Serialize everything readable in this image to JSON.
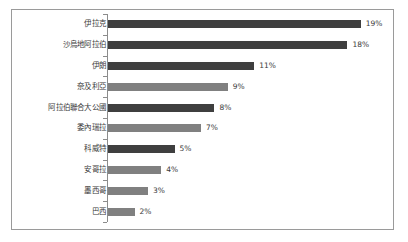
{
  "chart_data": {
    "type": "bar",
    "orientation": "horizontal",
    "title": "",
    "xlabel": "",
    "ylabel": "",
    "grid": false,
    "legend": null,
    "xlim": [
      0,
      20
    ],
    "value_suffix": "%",
    "categories": [
      "伊拉克",
      "沙烏地阿拉伯",
      "伊朗",
      "奈及利亞",
      "阿拉伯聯合大公國",
      "委內瑞拉",
      "科威特",
      "安哥拉",
      "墨西哥",
      "巴西"
    ],
    "values": [
      19,
      18,
      11,
      9,
      8,
      7,
      5,
      4,
      3,
      2
    ],
    "value_labels": [
      "19%",
      "18%",
      "11%",
      "9%",
      "8%",
      "7%",
      "5%",
      "4%",
      "3%",
      "2%"
    ],
    "bar_colors": [
      "#3f3f3f",
      "#3f3f3f",
      "#3f3f3f",
      "#808080",
      "#3f3f3f",
      "#808080",
      "#3f3f3f",
      "#808080",
      "#808080",
      "#808080"
    ]
  },
  "colors": {
    "dark_bar": "#3f3f3f",
    "gray_bar": "#808080",
    "axis": "#8c8c8c",
    "border": "#9a9a9a",
    "text": "#3a3a3a",
    "background": "#ffffff"
  }
}
